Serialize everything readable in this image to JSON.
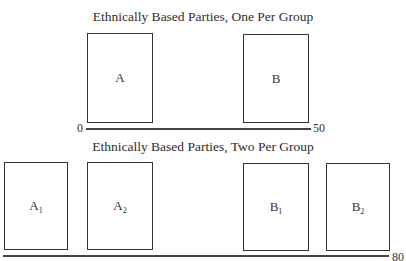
{
  "diagram": {
    "panels": [
      {
        "title": "Ethnically Based Parties, One Per Group",
        "axis": {
          "min_label": "0",
          "max_label": "50"
        },
        "parties": [
          {
            "label": "A",
            "sub": ""
          },
          {
            "label": "B",
            "sub": ""
          }
        ]
      },
      {
        "title": "Ethnically Based Parties, Two Per Group",
        "axis": {
          "min_label": "0",
          "max_label": "80"
        },
        "parties": [
          {
            "label": "A",
            "sub": "1"
          },
          {
            "label": "A",
            "sub": "2"
          },
          {
            "label": "B",
            "sub": "1"
          },
          {
            "label": "B",
            "sub": "2"
          }
        ]
      }
    ]
  }
}
